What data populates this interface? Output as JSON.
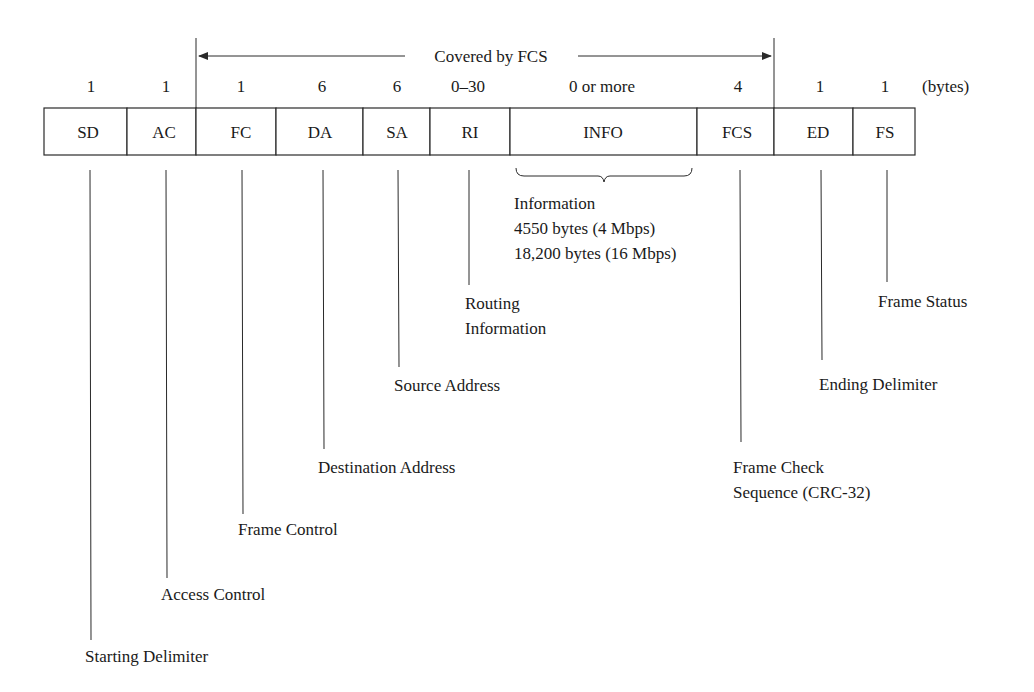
{
  "diagram": {
    "fcs_coverage_label": "Covered by FCS",
    "units_label": "(bytes)",
    "fields": [
      {
        "abbr": "SD",
        "size": "1",
        "name": "Starting Delimiter"
      },
      {
        "abbr": "AC",
        "size": "1",
        "name": "Access Control"
      },
      {
        "abbr": "FC",
        "size": "1",
        "name": "Frame Control"
      },
      {
        "abbr": "DA",
        "size": "6",
        "name": "Destination Address"
      },
      {
        "abbr": "SA",
        "size": "6",
        "name": "Source Address"
      },
      {
        "abbr": "RI",
        "size": "0–30",
        "name_line1": "Routing",
        "name_line2": "Information"
      },
      {
        "abbr": "INFO",
        "size": "0 or more",
        "name": "Information",
        "detail_line1": "4550 bytes (4 Mbps)",
        "detail_line2": "18,200 bytes (16 Mbps)"
      },
      {
        "abbr": "FCS",
        "size": "4",
        "name_line1": "Frame Check",
        "name_line2": "Sequence (CRC-32)"
      },
      {
        "abbr": "ED",
        "size": "1",
        "name": "Ending Delimiter"
      },
      {
        "abbr": "FS",
        "size": "1",
        "name": "Frame Status"
      }
    ]
  }
}
